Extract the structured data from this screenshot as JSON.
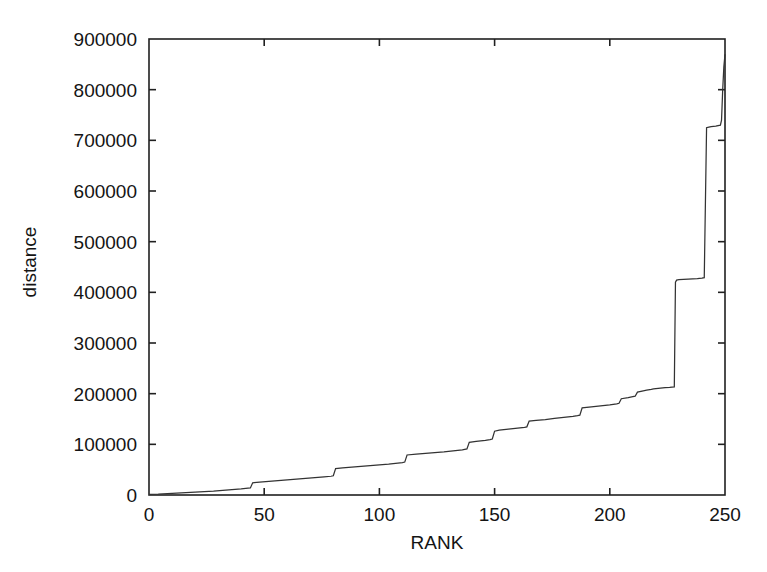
{
  "figure": {
    "background_color": "#ffffff",
    "line_color": "#333333",
    "axis_color": "#202020",
    "text_color": "#141414"
  },
  "chart_data": {
    "type": "line",
    "title": "",
    "subtitle": "",
    "xlabel": "RANK",
    "ylabel": "distance",
    "xlim": [
      0,
      250
    ],
    "ylim": [
      0,
      900000
    ],
    "xticks": [
      0,
      50,
      100,
      150,
      200,
      250
    ],
    "xtick_labels": [
      "0",
      "50",
      "100",
      "150",
      "200",
      "250"
    ],
    "yticks": [
      0,
      100000,
      200000,
      300000,
      400000,
      500000,
      600000,
      700000,
      800000,
      900000
    ],
    "ytick_labels": [
      "0",
      "100000",
      "200000",
      "300000",
      "400000",
      "500000",
      "600000",
      "700000",
      "800000",
      "900000"
    ],
    "grid": false,
    "legend": null,
    "legend_position": "none",
    "tick_direction": "in",
    "frame": "full-box",
    "annotations": [],
    "series": [
      {
        "name": "distance",
        "color": "#333333",
        "x": [
          0,
          4,
          8,
          12,
          16,
          20,
          24,
          28,
          32,
          36,
          40,
          43,
          44,
          45,
          48,
          52,
          56,
          60,
          64,
          68,
          72,
          76,
          79,
          80,
          81,
          84,
          88,
          92,
          96,
          100,
          104,
          108,
          110,
          111,
          112,
          116,
          120,
          124,
          128,
          132,
          136,
          137,
          138,
          139,
          142,
          146,
          148,
          149,
          150,
          152,
          156,
          160,
          163,
          164,
          165,
          168,
          172,
          176,
          180,
          184,
          186,
          187,
          188,
          192,
          196,
          200,
          203,
          204,
          205,
          208,
          210,
          211,
          212,
          214,
          215,
          216,
          218,
          219,
          220,
          222,
          224,
          226,
          227,
          228,
          228.5,
          229,
          230,
          234,
          238,
          240,
          241,
          242,
          243,
          244,
          246,
          247,
          248,
          248.5,
          249,
          249.5,
          250
        ],
        "y": [
          1000,
          1500,
          2500,
          3500,
          4500,
          5500,
          6500,
          7500,
          9000,
          10500,
          12000,
          13500,
          14000,
          24000,
          25500,
          27000,
          28500,
          30000,
          31500,
          33000,
          34500,
          36000,
          37000,
          38000,
          52000,
          53500,
          55000,
          56500,
          58000,
          59500,
          61000,
          63000,
          64000,
          65000,
          79000,
          80500,
          82000,
          83500,
          85000,
          87000,
          89000,
          90000,
          91000,
          104000,
          106000,
          108000,
          109500,
          110500,
          126000,
          128000,
          130000,
          132000,
          133500,
          134500,
          146000,
          147500,
          149000,
          151000,
          153000,
          155000,
          156500,
          157500,
          172000,
          174000,
          176000,
          178000,
          180000,
          181000,
          190000,
          192000,
          194000,
          195000,
          203000,
          205000,
          206000,
          207000,
          208500,
          209500,
          210000,
          211000,
          212000,
          212500,
          213000,
          213500,
          420000,
          424000,
          425000,
          426000,
          427000,
          428000,
          429000,
          725000,
          726000,
          727000,
          728000,
          729000,
          730000,
          740000,
          800000,
          845000,
          870000
        ]
      }
    ]
  }
}
